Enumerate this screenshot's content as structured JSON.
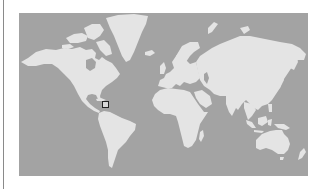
{
  "map": {
    "projection": "mercator",
    "colors": {
      "water": "#a3a3a3",
      "land": "#e4e4e4",
      "marker_border": "#222222",
      "marker_fill": "#d8d8d8",
      "left_rule": "#8a8a8a"
    },
    "marker": {
      "icon": "square-marker-icon",
      "region": "Caribbean Sea",
      "x": 102,
      "y": 101
    }
  }
}
